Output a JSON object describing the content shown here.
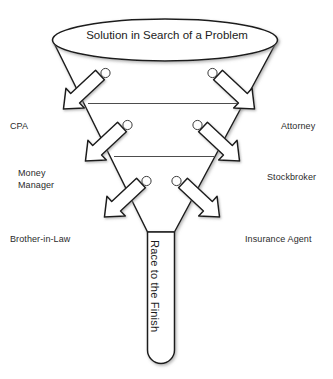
{
  "diagram": {
    "type": "funnel-leak-diagram",
    "funnel": {
      "title": "Solution in Search of\na Problem",
      "title_line_1": "Solution in Search of",
      "title_line_2": "a Problem",
      "outlet_label": "Race to the Finish",
      "stroke_color": "#1c1c1c",
      "fill_color": "#ffffff",
      "divider_count": 2,
      "leak_hole_count": 6
    },
    "leak_arrows": [
      {
        "id": "cpa",
        "label": "CPA",
        "side": "left",
        "level": 1
      },
      {
        "id": "attorney",
        "label": "Attorney",
        "side": "right",
        "level": 1
      },
      {
        "id": "money-manager",
        "label": "Money\nManager",
        "side": "left",
        "level": 2
      },
      {
        "id": "stockbroker",
        "label": "Stockbroker",
        "side": "right",
        "level": 2
      },
      {
        "id": "brother-in-law",
        "label": "Brother-in-Law",
        "side": "left",
        "level": 3
      },
      {
        "id": "insurance-agent",
        "label": "Insurance Agent",
        "side": "right",
        "level": 3
      }
    ],
    "labels": {
      "cpa": "CPA",
      "attorney": "Attorney",
      "money_manager": "Money\nManager",
      "stockbroker": "Stockbroker",
      "brother_in_law": "Brother-in-Law",
      "insurance_agent": "Insurance Agent"
    },
    "colors": {
      "background": "#ffffff",
      "outline": "#1c1c1c",
      "divider": "#4d4d4d",
      "text": "#2b2b2b",
      "arrow_fill": "#ffffff",
      "shadow": "#b0b0b0"
    }
  }
}
